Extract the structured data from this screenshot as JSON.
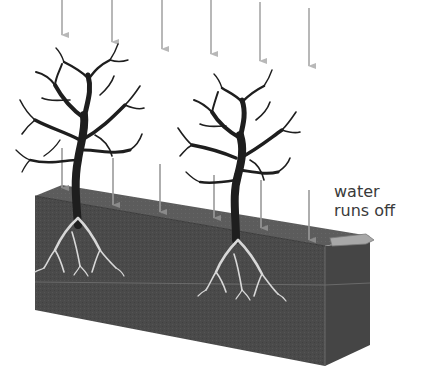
{
  "diagram": {
    "labels": {
      "runoff_line1": "water",
      "runoff_line2": "runs off"
    },
    "colors": {
      "background": "#ffffff",
      "soil_front": "#4a4a4a",
      "soil_top": "#5a5a5a",
      "soil_side": "#444444",
      "rain_arrow": "#b8b8b8",
      "tree": "#1e1e1e",
      "roots": "#d8d8d8",
      "runoff_arrow": "#9a9a9a",
      "text": "#3a3a3a"
    },
    "rain_arrows_top": [
      {
        "x": 62,
        "y1": 0,
        "y2": 35
      },
      {
        "x": 112,
        "y1": 0,
        "y2": 42
      },
      {
        "x": 162,
        "y1": 0,
        "y2": 49
      },
      {
        "x": 211,
        "y1": 0,
        "y2": 54
      },
      {
        "x": 260,
        "y1": 2,
        "y2": 61
      },
      {
        "x": 309,
        "y1": 8,
        "y2": 66
      }
    ],
    "rain_arrows_lower": [
      {
        "x": 62,
        "y1": 148,
        "y2": 188
      },
      {
        "x": 113,
        "y1": 158,
        "y2": 205
      },
      {
        "x": 160,
        "y1": 164,
        "y2": 212
      },
      {
        "x": 214,
        "y1": 175,
        "y2": 218
      },
      {
        "x": 261,
        "y1": 180,
        "y2": 228
      },
      {
        "x": 309,
        "y1": 190,
        "y2": 240
      }
    ],
    "trees": [
      {
        "name": "left-tree",
        "trunk_x": 78,
        "base_y": 205,
        "crown_cx": 80,
        "crown_cy": 105
      },
      {
        "name": "right-tree",
        "trunk_x": 236,
        "base_y": 235,
        "crown_cx": 240,
        "crown_cy": 140
      }
    ]
  }
}
